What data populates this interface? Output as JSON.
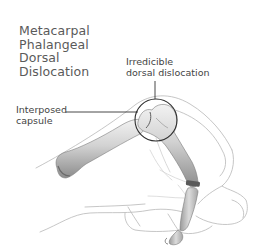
{
  "figure": {
    "title_lines": [
      "Metacarpal",
      "Phalangeal",
      "Dorsal",
      "Dislocation"
    ],
    "labels": {
      "dislocation": [
        "Irredicible",
        "dorsal dislocation"
      ],
      "capsule": [
        "Interposed",
        "capsule"
      ]
    },
    "colors": {
      "background": "#ffffff",
      "title_text": "#5a5a5a",
      "label_text": "#444444",
      "leader_line": "#333333",
      "bone_light": "#e6e6e6",
      "bone_mid": "#bdbdbd",
      "bone_dark": "#7a7a7a",
      "skin_outline": "#b5b5b5",
      "circle_stroke": "#2e2e2e"
    }
  }
}
